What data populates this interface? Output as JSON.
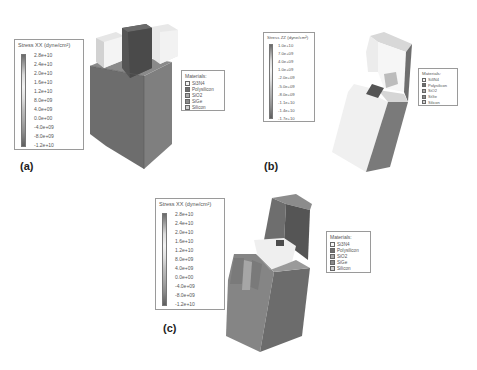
{
  "figure": {
    "panels": [
      {
        "label": "(a)",
        "stress_legend": {
          "title": "Stress XX (dyne/cm²)",
          "ticks": [
            "2.8e+10",
            "2.4e+10",
            "2.0e+10",
            "1.6e+10",
            "1.2e+10",
            "8.0e+09",
            "4.0e+09",
            "0.0e+00",
            "-4.0e+09",
            "-8.0e+09",
            "-1.2e+10"
          ]
        },
        "materials_legend": {
          "title": "Materials:",
          "items": [
            "Si3N4",
            "Polysilicon",
            "SiO2",
            "SiGe",
            "Silicon"
          ]
        }
      },
      {
        "label": "(b)",
        "stress_legend": {
          "title": "Stress ZZ (dyne/cm²)",
          "ticks": [
            "1.0e+10",
            "7.0e+09",
            "4.0e+09",
            "1.0e+09",
            "-2.0e+09",
            "-5.0e+09",
            "-8.0e+09",
            "-1.1e+10",
            "-1.4e+10",
            "-1.7e+10"
          ]
        },
        "materials_legend": {
          "title": "Materials:",
          "items": [
            "Si3N4",
            "Polysilicon",
            "SiO2",
            "SiGe",
            "Silicon"
          ]
        }
      },
      {
        "label": "(c)",
        "stress_legend": {
          "title": "Stress XX (dyne/cm²)",
          "ticks": [
            "2.8e+10",
            "2.4e+10",
            "2.0e+10",
            "1.6e+10",
            "1.2e+10",
            "8.0e+09",
            "4.0e+09",
            "0.0e+00",
            "-4.0e+09",
            "-8.0e+09",
            "-1.2e+10"
          ]
        },
        "materials_legend": {
          "title": "Materials:",
          "items": [
            "Si3N4",
            "Polysilicon",
            "SiO2",
            "SiGe",
            "Silicon"
          ]
        }
      }
    ],
    "material_colors": {
      "Si3N4": "#f4f4f4",
      "Polysilicon": "#6e6e6e",
      "SiO2": "#a8a8a8",
      "SiGe": "#8a8a8a",
      "Silicon": "#cfcfcf"
    }
  }
}
